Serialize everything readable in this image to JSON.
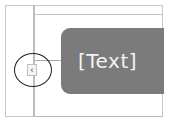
{
  "panel": {
    "text": "[Text]",
    "background_color": "#7b7b7b",
    "text_color": "#f2f2f2"
  },
  "collapse_button": {
    "icon": "chevron-left-icon",
    "glyph": "‹"
  },
  "annotation": {
    "shape": "circle",
    "color": "#222222"
  }
}
